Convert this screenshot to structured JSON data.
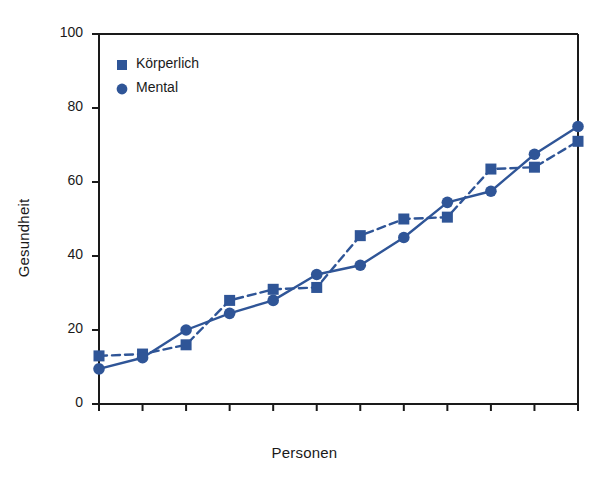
{
  "chart_data": {
    "type": "line",
    "title": "",
    "xlabel": "Personen",
    "ylabel": "Gesundheit",
    "ylim": [
      0,
      100
    ],
    "yticks": [
      0,
      20,
      40,
      60,
      80,
      100
    ],
    "ytick_labels": [
      "0",
      "20",
      "40",
      "60",
      "80",
      "100"
    ],
    "xlim": [
      0,
      11
    ],
    "xticks": [
      0,
      1,
      2,
      3,
      4,
      5,
      6,
      7,
      8,
      9,
      10,
      11
    ],
    "xtick_labels": [
      "",
      "",
      "",
      "",
      "",
      "",
      "",
      "",
      "",
      "",
      "",
      ""
    ],
    "grid": false,
    "legend_position": "top-left",
    "x": [
      0,
      1,
      2,
      3,
      4,
      5,
      6,
      7,
      8,
      9,
      10,
      11
    ],
    "series": [
      {
        "name": "Körperlich",
        "marker": "square",
        "linestyle": "dashed",
        "color": "#2F5597",
        "values": [
          13,
          13.5,
          16,
          28,
          31,
          31.5,
          45.5,
          50,
          50.5,
          63.5,
          64,
          71
        ]
      },
      {
        "name": "Mental",
        "marker": "circle",
        "linestyle": "solid",
        "color": "#2F5597",
        "values": [
          9.5,
          12.5,
          20,
          24.5,
          28,
          35,
          37.5,
          45,
          54.5,
          57.5,
          67.5,
          75
        ]
      }
    ]
  },
  "legend": {
    "items": [
      {
        "label": "Körperlich",
        "marker": "square-marker",
        "color": "#2F5597"
      },
      {
        "label": "Mental",
        "marker": "circle-marker",
        "color": "#2F5597"
      }
    ]
  },
  "colors": {
    "series_blue": "#2F5597",
    "axis_black": "#1a1a1a",
    "background": "#ffffff"
  }
}
